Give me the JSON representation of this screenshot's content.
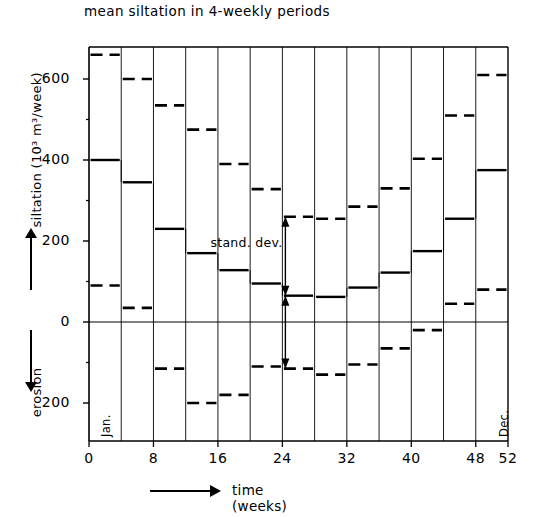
{
  "title": "mean siltation in 4-weekly periods",
  "axes": {
    "y_label_positive": "siltation (10",
    "y_label_exponent": "3",
    "y_label_units": " m",
    "y_label_units_exp": "3",
    "y_label_units_tail": "/week)",
    "y_label_full": "siltation (10³ m³/week)",
    "y_label_negative": "erosion",
    "x_label": "time (weeks)",
    "y_ticks": [
      "600",
      "400",
      "200",
      "0",
      "200"
    ],
    "y_tick_values": [
      600,
      400,
      200,
      0,
      -200
    ],
    "x_ticks": [
      "0",
      "8",
      "16",
      "24",
      "32",
      "40",
      "48",
      "52"
    ],
    "x_tick_values": [
      0,
      8,
      16,
      24,
      32,
      40,
      48,
      52
    ],
    "ylim": [
      -260,
      700
    ],
    "xlim": [
      0,
      52
    ],
    "grid": "vertical period separators only",
    "zero_line": true
  },
  "annotations": {
    "stand_dev": "stand. dev.",
    "month_first": "Jan.",
    "month_last": "Dec.",
    "stand_dev_period_index": 6
  },
  "colors": {
    "ink": "#000000",
    "background": "#ffffff"
  },
  "chart_data": {
    "type": "bar",
    "title": "mean siltation in 4-weekly periods",
    "xlabel": "time (weeks)",
    "ylabel": "siltation (10³ m³/week)",
    "ylim": [
      -260,
      700
    ],
    "xlim": [
      0,
      52
    ],
    "grid": false,
    "legend": "none",
    "categories": [
      "0-4",
      "4-8",
      "8-12",
      "12-16",
      "16-20",
      "20-24",
      "24-28",
      "28-32",
      "32-36",
      "36-40",
      "40-44",
      "44-48",
      "48-52"
    ],
    "x_start": [
      0,
      4,
      8,
      12,
      16,
      20,
      24,
      28,
      32,
      36,
      40,
      44,
      48
    ],
    "x_end": [
      4,
      8,
      12,
      16,
      20,
      24,
      28,
      32,
      36,
      40,
      44,
      48,
      52
    ],
    "series": [
      {
        "name": "mean siltation",
        "style": "solid",
        "values": [
          400,
          345,
          230,
          170,
          128,
          95,
          65,
          62,
          85,
          122,
          175,
          255,
          375
        ]
      },
      {
        "name": "mean + 1 stand. dev.",
        "style": "dashed",
        "values": [
          660,
          600,
          535,
          475,
          390,
          328,
          260,
          255,
          285,
          330,
          403,
          510,
          610
        ]
      },
      {
        "name": "mean - 1 stand. dev.",
        "style": "dashed",
        "values": [
          90,
          35,
          -115,
          -200,
          -180,
          -110,
          -115,
          -130,
          -105,
          -65,
          -20,
          45,
          80
        ]
      }
    ]
  }
}
